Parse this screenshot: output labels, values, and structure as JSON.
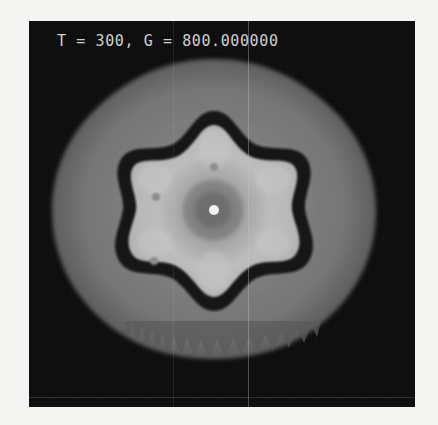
{
  "figure": {
    "caption": "T = 300, G = 800.000000",
    "parameters": {
      "T": "300",
      "G": "800.000000"
    },
    "colors": {
      "background": "#0d0d0d",
      "outer_halo": "#6e6e6e",
      "boundary_ring": "#151515",
      "inner_body": "#b4b4b4",
      "core_shadow": "#7a7a7a",
      "center_dot": "#f2f2f2",
      "caption_text": "#cfcfcf"
    },
    "shape": {
      "symmetry": "six-fold",
      "description": "hexagonal snowflake-like crystal with dark boundary ring, gray outer halo and bright center point"
    }
  }
}
